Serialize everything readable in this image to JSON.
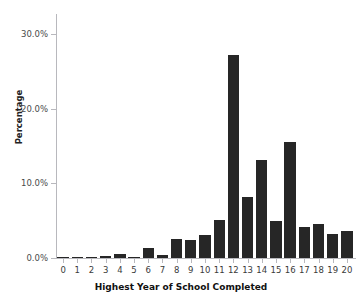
{
  "chart_data": {
    "type": "bar",
    "title": "",
    "xlabel": "Highest Year of School Completed",
    "ylabel": "Percentage",
    "categories": [
      "0",
      "1",
      "2",
      "3",
      "4",
      "5",
      "6",
      "7",
      "8",
      "9",
      "10",
      "11",
      "12",
      "13",
      "14",
      "15",
      "16",
      "17",
      "18",
      "19",
      "20"
    ],
    "values": [
      0.12,
      0.1,
      0.12,
      0.3,
      0.5,
      0.15,
      1.4,
      0.45,
      2.5,
      2.4,
      3.1,
      5.1,
      27.2,
      8.2,
      13.1,
      4.9,
      15.5,
      4.1,
      4.6,
      3.2,
      3.6
    ],
    "ytick_labels": [
      "0.0%",
      "10.0%",
      "20.0%",
      "30.0%"
    ],
    "ytick_values": [
      0,
      10,
      20,
      30
    ],
    "ylim": [
      0,
      32.7
    ],
    "xlim": [
      -0.5,
      20.5
    ],
    "grid": false,
    "legend": false,
    "bar_color": "#262626",
    "axis_color": "#b8b8bd",
    "text_color": "#3a3a3a"
  }
}
